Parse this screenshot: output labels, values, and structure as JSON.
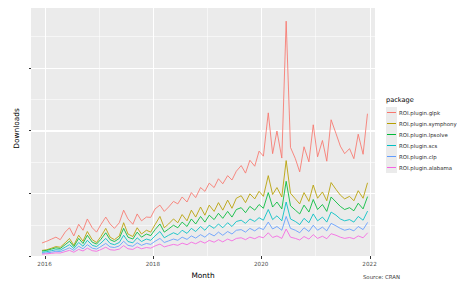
{
  "chart_data": {
    "type": "line",
    "title": "",
    "subtitle": "",
    "caption": "Source: CRAN",
    "xlabel": "Month",
    "ylabel": "Downloads",
    "legend_title": "package",
    "legend_position": "right",
    "grid": true,
    "xlim": [
      2015.75,
      2022.1
    ],
    "ylim": [
      0,
      7900
    ],
    "x_ticks": [
      2016,
      2018,
      2020,
      2022
    ],
    "x_tick_labels": [
      "2016",
      "2018",
      "2020",
      "2022"
    ],
    "y_ticks": [
      0,
      2000,
      4000,
      6000
    ],
    "y_tick_labels": [
      "0",
      "2000",
      "4000",
      "6000"
    ],
    "y_minor_ticks": [
      1000,
      3000,
      5000,
      7000
    ],
    "x_minor_ticks": [
      2017,
      2019,
      2021
    ],
    "x": [
      2015.96,
      2016.04,
      2016.13,
      2016.21,
      2016.29,
      2016.38,
      2016.46,
      2016.54,
      2016.63,
      2016.71,
      2016.79,
      2016.88,
      2016.96,
      2017.04,
      2017.13,
      2017.21,
      2017.29,
      2017.38,
      2017.46,
      2017.54,
      2017.63,
      2017.71,
      2017.79,
      2017.88,
      2017.96,
      2018.04,
      2018.13,
      2018.21,
      2018.29,
      2018.38,
      2018.46,
      2018.54,
      2018.63,
      2018.71,
      2018.79,
      2018.88,
      2018.96,
      2019.04,
      2019.13,
      2019.21,
      2019.29,
      2019.38,
      2019.46,
      2019.54,
      2019.63,
      2019.71,
      2019.79,
      2019.88,
      2019.96,
      2020.04,
      2020.13,
      2020.21,
      2020.29,
      2020.38,
      2020.46,
      2020.54,
      2020.63,
      2020.71,
      2020.79,
      2020.88,
      2020.96,
      2021.04,
      2021.13,
      2021.21,
      2021.29,
      2021.38,
      2021.46,
      2021.54,
      2021.63,
      2021.71,
      2021.79,
      2021.88,
      2021.96
    ],
    "series": [
      {
        "name": "ROI.plugin.glpk",
        "color": "#f8766d",
        "values": [
          420,
          470,
          540,
          600,
          520,
          760,
          900,
          640,
          1010,
          820,
          1180,
          900,
          760,
          1000,
          1240,
          1020,
          880,
          1060,
          1460,
          1180,
          1010,
          1340,
          1120,
          1240,
          1230,
          1500,
          1620,
          1420,
          1560,
          1740,
          1660,
          1880,
          1720,
          2020,
          1860,
          2180,
          2060,
          2320,
          2180,
          2460,
          2300,
          2560,
          2420,
          2700,
          2880,
          2640,
          3050,
          2860,
          3340,
          3180,
          4560,
          3260,
          3980,
          3120,
          7480,
          3460,
          3100,
          2680,
          3480,
          3000,
          4180,
          3160,
          3680,
          3020,
          4340,
          3900,
          3500,
          3260,
          3420,
          3100,
          3880,
          3240,
          4520
        ]
      },
      {
        "name": "ROI.plugin.symphony",
        "color": "#b79f00",
        "values": [
          180,
          200,
          250,
          300,
          280,
          420,
          560,
          340,
          660,
          470,
          780,
          520,
          430,
          620,
          880,
          600,
          520,
          640,
          1060,
          700,
          620,
          900,
          700,
          820,
          760,
          1000,
          1260,
          900,
          1020,
          1180,
          1060,
          1320,
          1120,
          1460,
          1240,
          1560,
          1300,
          1620,
          1420,
          1700,
          1460,
          1780,
          1520,
          1840,
          1920,
          1700,
          1980,
          1820,
          2060,
          1900,
          2560,
          1960,
          2180,
          1880,
          3040,
          2000,
          1820,
          1660,
          2020,
          1740,
          2260,
          1840,
          2040,
          1760,
          2340,
          2120,
          1940,
          1820,
          1900,
          1760,
          2080,
          1840,
          2320
        ]
      },
      {
        "name": "ROI.plugin.lpsolve",
        "color": "#00ba38",
        "values": [
          160,
          180,
          220,
          260,
          240,
          360,
          470,
          300,
          560,
          400,
          660,
          440,
          380,
          530,
          740,
          520,
          460,
          560,
          880,
          600,
          540,
          760,
          600,
          700,
          650,
          840,
          1020,
          760,
          860,
          980,
          900,
          1080,
          940,
          1180,
          1020,
          1260,
          1080,
          1300,
          1160,
          1360,
          1200,
          1420,
          1240,
          1480,
          1540,
          1380,
          1580,
          1460,
          1640,
          1520,
          2020,
          1560,
          1720,
          1500,
          2380,
          1600,
          1460,
          1340,
          1620,
          1400,
          1800,
          1480,
          1640,
          1420,
          1880,
          1720,
          1580,
          1480,
          1540,
          1440,
          1680,
          1500,
          1880
        ]
      },
      {
        "name": "ROI.plugin.scs",
        "color": "#00bfc4",
        "values": [
          120,
          140,
          170,
          200,
          190,
          280,
          360,
          240,
          430,
          310,
          500,
          340,
          300,
          410,
          560,
          400,
          360,
          430,
          660,
          460,
          420,
          580,
          460,
          540,
          500,
          640,
          780,
          580,
          660,
          740,
          680,
          820,
          720,
          880,
          780,
          940,
          820,
          980,
          880,
          1020,
          900,
          1060,
          940,
          1100,
          1140,
          1040,
          1180,
          1100,
          1220,
          1140,
          1480,
          1160,
          1280,
          1120,
          1720,
          1180,
          1100,
          1000,
          1200,
          1060,
          1340,
          1120,
          1240,
          1080,
          1400,
          1300,
          1180,
          1120,
          1160,
          1080,
          1260,
          1140,
          1420
        ]
      },
      {
        "name": "ROI.plugin.clp",
        "color": "#619cff",
        "values": [
          90,
          100,
          120,
          150,
          140,
          200,
          260,
          180,
          310,
          230,
          360,
          250,
          220,
          300,
          400,
          290,
          270,
          320,
          470,
          340,
          310,
          420,
          340,
          400,
          370,
          470,
          560,
          430,
          480,
          540,
          500,
          600,
          530,
          640,
          570,
          680,
          600,
          720,
          640,
          760,
          660,
          780,
          700,
          820,
          840,
          760,
          880,
          800,
          900,
          840,
          1080,
          860,
          940,
          820,
          1260,
          880,
          820,
          740,
          900,
          780,
          980,
          820,
          920,
          800,
          1040,
          960,
          880,
          820,
          860,
          800,
          940,
          840,
          1060
        ]
      },
      {
        "name": "ROI.plugin.alabama",
        "color": "#f564e3",
        "values": [
          60,
          70,
          85,
          100,
          95,
          140,
          180,
          120,
          210,
          160,
          250,
          170,
          150,
          205,
          280,
          200,
          185,
          220,
          330,
          230,
          210,
          290,
          230,
          270,
          250,
          320,
          380,
          290,
          330,
          370,
          340,
          410,
          360,
          440,
          390,
          470,
          410,
          500,
          440,
          520,
          450,
          540,
          480,
          560,
          580,
          520,
          600,
          550,
          620,
          580,
          740,
          590,
          640,
          560,
          860,
          600,
          560,
          510,
          620,
          540,
          680,
          560,
          630,
          550,
          710,
          660,
          600,
          560,
          590,
          550,
          640,
          580,
          730
        ]
      }
    ]
  }
}
